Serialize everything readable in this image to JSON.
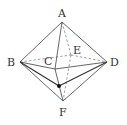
{
  "diagram": {
    "labels": {
      "A": "A",
      "B": "B",
      "C": "C",
      "D": "D",
      "E": "E",
      "F": "F"
    },
    "colors": {
      "line": "#555555",
      "dashed": "#777777",
      "point": "#111111",
      "text": "#333333"
    }
  }
}
